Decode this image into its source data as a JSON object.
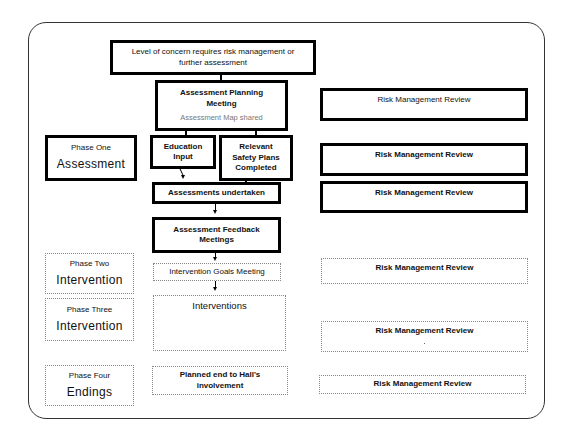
{
  "diagram": {
    "top_box": {
      "text": "Level of concern requires risk management or further assessment"
    },
    "planning_meeting": {
      "title": "Assessment Planning Meeting",
      "subtitle": "Assessment Map shared"
    },
    "education_input": {
      "text": "Education Input"
    },
    "safety_plans": {
      "text": "Relevant Safety Plans Completed"
    },
    "assessments_undertaken": {
      "text": "Assessments undertaken"
    },
    "feedback_meetings": {
      "text": "Assessment Feedback Meetings"
    },
    "goals_meeting": {
      "text": "Intervention Goals Meeting"
    },
    "interventions": {
      "text": "Interventions"
    },
    "planned_end": {
      "text": "Planned end to Hall's involvement"
    },
    "phases": [
      {
        "label": "Phase One",
        "name": "Assessment"
      },
      {
        "label": "Phase Two",
        "name": "Intervention"
      },
      {
        "label": "Phase Three",
        "name": "Intervention"
      },
      {
        "label": "Phase Four",
        "name": "Endings"
      }
    ],
    "risk_reviews": [
      {
        "text": "Risk Management Review"
      },
      {
        "text": "Risk Management Review"
      },
      {
        "text": "Risk Management Review"
      },
      {
        "text": "Risk Management Review"
      },
      {
        "text": "Risk Management Review"
      },
      {
        "text": "Risk Management Review"
      }
    ]
  }
}
